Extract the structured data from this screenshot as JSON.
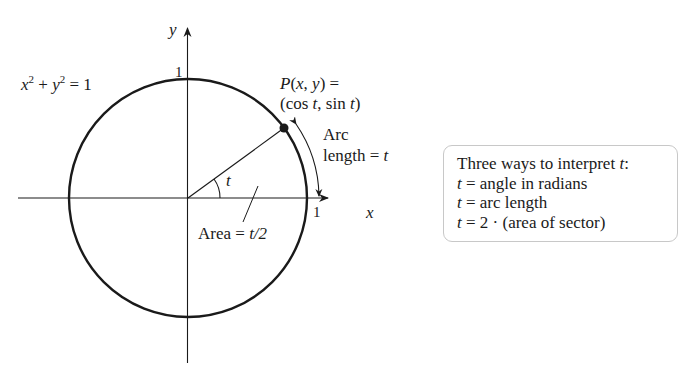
{
  "figure": {
    "type": "unit-circle-diagram",
    "axes": {
      "x_label": "x",
      "y_label": "y",
      "x_tick": "1",
      "y_tick": "1"
    },
    "circle": {
      "equation_lhs_x": "x",
      "equation_exp1": "2",
      "equation_plus": " + ",
      "equation_lhs_y": "y",
      "equation_exp2": "2",
      "equation_rhs": " = 1",
      "center_px": [
        188,
        198
      ],
      "radius_px": 119
    },
    "point": {
      "name": "P",
      "coords_open": "(",
      "coords_x": "x",
      "coords_sep": ", ",
      "coords_y": "y",
      "coords_close": ") =",
      "param_open": "(cos ",
      "param_t1": "t",
      "param_mid": ", sin ",
      "param_t2": "t",
      "param_close": ")",
      "angle_deg": 36
    },
    "angle_label": "t",
    "arc_label_line1": "Arc",
    "arc_label_line2": "length = ",
    "arc_label_t": "t",
    "area_label": "Area = ",
    "area_value": "t/2"
  },
  "legend_box": {
    "title_prefix": "Three ways to interpret ",
    "title_var": "t",
    "title_suffix": ":",
    "items": [
      {
        "var": "t",
        "text": " = angle in radians"
      },
      {
        "var": "t",
        "text": " = arc length"
      },
      {
        "var": "t",
        "text": " = 2 · (area of sector)"
      }
    ]
  }
}
